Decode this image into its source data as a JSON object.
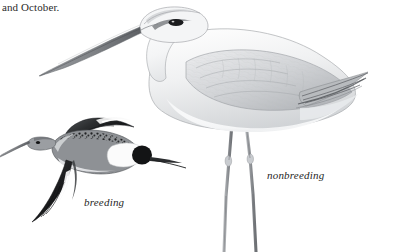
{
  "page": {
    "width": 404,
    "height": 252,
    "background_color": "#ffffff",
    "kind": "field-guide-plate"
  },
  "caption": {
    "text": "and October."
  },
  "labels": {
    "breeding": "breeding",
    "nonbreeding": "nonbreeding"
  },
  "illustration": {
    "title": "shorebird-plate",
    "subjects": [
      {
        "name": "standing-shorebird",
        "plumage": "nonbreeding",
        "pose": "standing",
        "description": "large pale gray wader standing, long slightly downcurved bill, dark eye line, long legs",
        "bill": "long-slightly-downcurved",
        "leg_count": 2
      },
      {
        "name": "flying-shorebird",
        "plumage": "breeding",
        "pose": "flying",
        "description": "smaller shorebird in flight, dark speckled back, white wing stripe, white rump, black tail band, long straight bill",
        "bill": "long-straight",
        "wing_count": 2
      }
    ]
  },
  "colors": {
    "background": "#ffffff",
    "text": "#2b2b2b",
    "label_text": "#1f1f1f",
    "plumage_pale": "#f2f2f3",
    "plumage_mid_gray": "#d5d7d9",
    "plumage_shadow": "#b4b7ba",
    "plumage_dark": "#6f7276",
    "plumage_black": "#1a1a1a",
    "outline": "#8a8d90",
    "leg_gray": "#9a9da0"
  }
}
